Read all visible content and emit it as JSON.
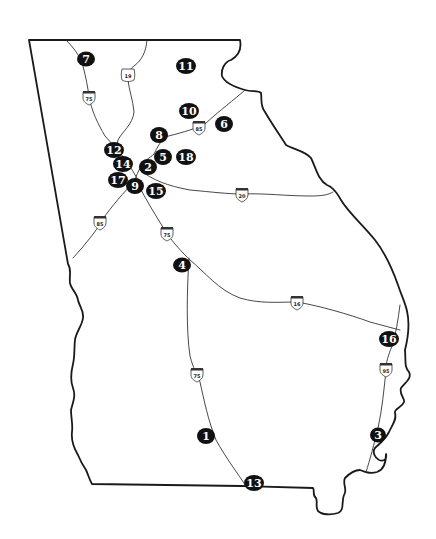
{
  "map": {
    "region": "Georgia",
    "colors": {
      "border": "#1a1a1a",
      "roads": "#333333",
      "marker_fill": "#111111",
      "marker_text": "#ffffff",
      "background": "#ffffff"
    },
    "markers": [
      {
        "label": "1",
        "x": 206,
        "y": 436
      },
      {
        "label": "2",
        "x": 148,
        "y": 167
      },
      {
        "label": "3",
        "x": 378,
        "y": 435
      },
      {
        "label": "4",
        "x": 182,
        "y": 265
      },
      {
        "label": "5",
        "x": 163,
        "y": 157
      },
      {
        "label": "6",
        "x": 224,
        "y": 124
      },
      {
        "label": "7",
        "x": 86,
        "y": 59
      },
      {
        "label": "8",
        "x": 159,
        "y": 135
      },
      {
        "label": "9",
        "x": 135,
        "y": 186
      },
      {
        "label": "10",
        "x": 189,
        "y": 111
      },
      {
        "label": "11",
        "x": 186,
        "y": 66
      },
      {
        "label": "12",
        "x": 114,
        "y": 150
      },
      {
        "label": "14",
        "x": 123,
        "y": 164
      },
      {
        "label": "15",
        "x": 156,
        "y": 191
      },
      {
        "label": "16",
        "x": 389,
        "y": 339
      },
      {
        "label": "17",
        "x": 118,
        "y": 180
      },
      {
        "label": "18",
        "x": 186,
        "y": 157
      },
      {
        "label": "13",
        "x": 254,
        "y": 483
      }
    ],
    "shields": [
      {
        "label": "19",
        "type": "us-route",
        "x": 128,
        "y": 75
      },
      {
        "label": "75",
        "type": "interstate",
        "x": 89,
        "y": 97
      },
      {
        "label": "85",
        "type": "interstate",
        "x": 199,
        "y": 127
      },
      {
        "label": "20",
        "type": "interstate",
        "x": 242,
        "y": 194
      },
      {
        "label": "85",
        "type": "interstate",
        "x": 100,
        "y": 222
      },
      {
        "label": "75",
        "type": "interstate",
        "x": 167,
        "y": 233
      },
      {
        "label": "16",
        "type": "interstate",
        "x": 297,
        "y": 302
      },
      {
        "label": "75",
        "type": "interstate",
        "x": 197,
        "y": 374
      },
      {
        "label": "95",
        "type": "interstate",
        "x": 386,
        "y": 369
      }
    ]
  }
}
